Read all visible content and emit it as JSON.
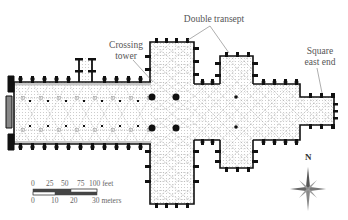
{
  "diagram": {
    "type": "architectural-floor-plan",
    "colors": {
      "walls": "#111111",
      "vault_lines": "#777777",
      "fill_stipple": "#bbbbbb",
      "label_text": "#555555",
      "leader_lines": "#777777"
    },
    "labels": {
      "crossing_tower": {
        "line1": "Crossing",
        "line2": "tower"
      },
      "double_transept": {
        "text": "Double transept"
      },
      "square_east_end": {
        "line1": "Square",
        "line2": "east end"
      }
    },
    "scale_bar": {
      "feet": {
        "ticks": [
          "0",
          "25",
          "50",
          "75",
          "100 feet"
        ]
      },
      "meters": {
        "ticks": [
          "0",
          "10",
          "20",
          "30 meters"
        ]
      }
    },
    "compass": {
      "label": "N"
    }
  }
}
